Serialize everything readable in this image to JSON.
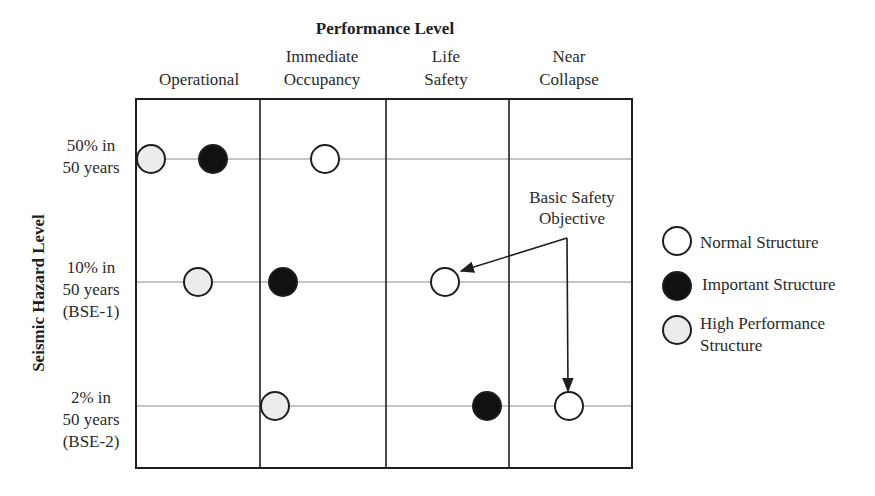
{
  "diagram": {
    "title": "Performance Level",
    "y_axis_label": "Seismic Hazard Level",
    "columns": [
      {
        "lines": [
          "Operational"
        ]
      },
      {
        "lines": [
          "Immediate",
          "Occupancy"
        ]
      },
      {
        "lines": [
          "Life",
          "Safety"
        ]
      },
      {
        "lines": [
          "Near",
          "Collapse"
        ]
      }
    ],
    "rows": [
      {
        "lines": [
          "50% in",
          "50 years"
        ]
      },
      {
        "lines": [
          "10% in",
          "50 years",
          "(BSE-1)"
        ]
      },
      {
        "lines": [
          "2% in",
          "50 years",
          "(BSE-2)"
        ]
      }
    ],
    "markers": [
      {
        "row": "50% in 50 years",
        "position": "Operational",
        "type": "High Performance Structure",
        "fill": "#ececec"
      },
      {
        "row": "50% in 50 years",
        "position": "Operational",
        "type": "Important Structure",
        "fill": "#111111"
      },
      {
        "row": "50% in 50 years",
        "position": "Immediate Occupancy",
        "type": "Normal Structure",
        "fill": "#ffffff"
      },
      {
        "row": "10% in 50 years (BSE-1)",
        "position": "Operational",
        "type": "High Performance Structure",
        "fill": "#ececec"
      },
      {
        "row": "10% in 50 years (BSE-1)",
        "position": "Immediate Occupancy (boundary)",
        "type": "Important Structure",
        "fill": "#111111"
      },
      {
        "row": "10% in 50 years (BSE-1)",
        "position": "Life Safety",
        "type": "Normal Structure",
        "fill": "#ffffff"
      },
      {
        "row": "2% in 50 years (BSE-2)",
        "position": "Immediate Occupancy (boundary)",
        "type": "High Performance Structure",
        "fill": "#ececec"
      },
      {
        "row": "2% in 50 years (BSE-2)",
        "position": "Life Safety (boundary)",
        "type": "Important Structure",
        "fill": "#111111"
      },
      {
        "row": "2% in 50 years (BSE-2)",
        "position": "Near Collapse",
        "type": "Normal Structure",
        "fill": "#ffffff"
      }
    ],
    "annotation": {
      "lines": [
        "Basic Safety",
        "Objective"
      ],
      "points_to": [
        "10% in 50 years (BSE-1) / Life Safety",
        "2% in 50 years (BSE-2) / Near Collapse"
      ]
    },
    "legend": [
      {
        "lines": [
          "Normal Structure"
        ],
        "fill": "#ffffff"
      },
      {
        "lines": [
          "Important Structure"
        ],
        "fill": "#111111"
      },
      {
        "lines": [
          "High Performance",
          "Structure"
        ],
        "fill": "#ececec"
      }
    ]
  }
}
